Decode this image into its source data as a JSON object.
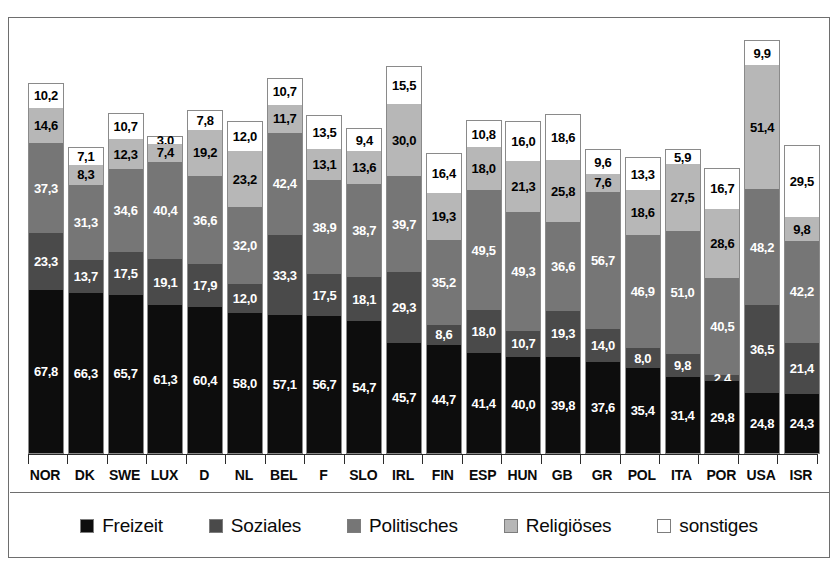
{
  "chart_data": {
    "type": "bar",
    "subtype": "stacked-bar",
    "title": "",
    "xlabel": "",
    "ylabel": "",
    "grid": false,
    "legend_position": "bottom",
    "ylim": [
      0,
      180
    ],
    "value_format": "comma-decimal",
    "categories": [
      "NOR",
      "DK",
      "SWE",
      "LUX",
      "D",
      "NL",
      "BEL",
      "F",
      "SLO",
      "IRL",
      "FIN",
      "ESP",
      "HUN",
      "GB",
      "GR",
      "POL",
      "ITA",
      "POR",
      "USA",
      "ISR"
    ],
    "series": [
      {
        "name": "Freizeit",
        "color": "#0d0d0d",
        "values": [
          67.8,
          66.3,
          65.7,
          61.3,
          60.4,
          58.0,
          57.1,
          56.7,
          54.7,
          45.7,
          44.7,
          41.4,
          40.0,
          39.8,
          37.6,
          35.4,
          31.4,
          29.8,
          24.8,
          24.3
        ],
        "labels": [
          "67,8",
          "66,3",
          "65,7",
          "61,3",
          "60,4",
          "58,0",
          "57,1",
          "56,7",
          "54,7",
          "45,7",
          "44,7",
          "41,4",
          "40,0",
          "39,8",
          "37,6",
          "35,4",
          "31,4",
          "29,8",
          "24,8",
          "24,3"
        ]
      },
      {
        "name": "Soziales",
        "color": "#4a4a4a",
        "values": [
          23.3,
          13.7,
          17.5,
          19.1,
          17.9,
          12.0,
          33.3,
          17.5,
          18.1,
          29.3,
          8.6,
          18.0,
          10.7,
          19.3,
          14.0,
          8.0,
          9.8,
          2.4,
          36.5,
          21.4
        ],
        "labels": [
          "23,3",
          "13,7",
          "17,5",
          "19,1",
          "17,9",
          "12,0",
          "33,3",
          "17,5",
          "18,1",
          "29,3",
          "8,6",
          "18,0",
          "10,7",
          "19,3",
          "14,0",
          "8,0",
          "9,8",
          "2,4",
          "36,5",
          "21,4"
        ]
      },
      {
        "name": "Politisches",
        "color": "#767676",
        "values": [
          37.3,
          31.3,
          34.6,
          40.4,
          36.6,
          32.0,
          42.4,
          38.9,
          38.7,
          39.7,
          35.2,
          49.5,
          49.3,
          36.6,
          56.7,
          46.9,
          51.0,
          40.5,
          48.2,
          42.2
        ],
        "labels": [
          "37,3",
          "31,3",
          "34,6",
          "40,4",
          "36,6",
          "32,0",
          "42,4",
          "38,9",
          "38,7",
          "39,7",
          "35,2",
          "49,5",
          "49,3",
          "36,6",
          "56,7",
          "46,9",
          "51,0",
          "40,5",
          "48,2",
          "42,2"
        ]
      },
      {
        "name": "Religiöses",
        "color": "#b7b7b7",
        "values": [
          14.6,
          8.3,
          12.3,
          7.4,
          19.2,
          23.2,
          11.7,
          13.1,
          13.6,
          30.0,
          19.3,
          18.0,
          21.3,
          25.8,
          7.6,
          18.6,
          27.5,
          28.6,
          51.4,
          9.8
        ],
        "labels": [
          "14,6",
          "8,3",
          "12,3",
          "7,4",
          "19,2",
          "23,2",
          "11,7",
          "13,1",
          "13,6",
          "30,0",
          "19,3",
          "18,0",
          "21,3",
          "25,8",
          "7,6",
          "18,6",
          "27,5",
          "28,6",
          "51,4",
          "9,8"
        ]
      },
      {
        "name": "sonstiges",
        "color": "#ffffff",
        "values": [
          10.2,
          7.1,
          10.7,
          3.0,
          7.8,
          12.0,
          10.7,
          13.5,
          9.4,
          15.5,
          16.4,
          10.8,
          16.0,
          18.6,
          9.6,
          13.3,
          5.9,
          16.7,
          9.9,
          29.5
        ],
        "labels": [
          "10,2",
          "7,1",
          "10,7",
          "3,0",
          "7,8",
          "12,0",
          "10,7",
          "13,5",
          "9,4",
          "15,5",
          "16,4",
          "10,8",
          "16,0",
          "18,6",
          "9,6",
          "13,3",
          "5,9",
          "16,7",
          "9,9",
          "29,5"
        ]
      }
    ]
  },
  "legend": {
    "items": [
      {
        "label": "Freizeit",
        "color": "#0d0d0d"
      },
      {
        "label": "Soziales",
        "color": "#4a4a4a"
      },
      {
        "label": "Politisches",
        "color": "#767676"
      },
      {
        "label": "Religiöses",
        "color": "#b7b7b7"
      },
      {
        "label": "sonstiges",
        "color": "#ffffff"
      }
    ]
  }
}
